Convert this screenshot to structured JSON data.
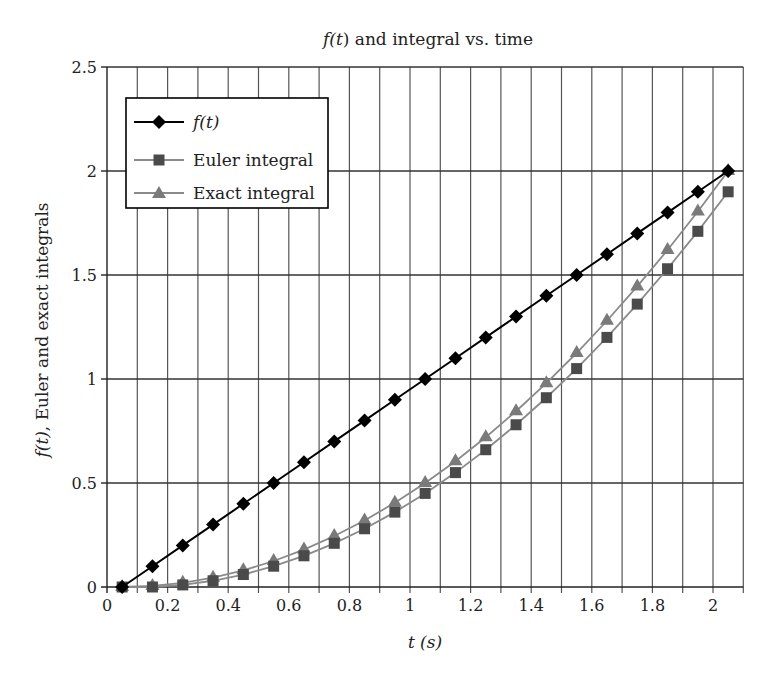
{
  "chart_data": {
    "type": "line",
    "title": "f(t) and integral vs. time",
    "xlabel": "t (s)",
    "ylabel": "f(t), Euler and exact integrals",
    "xlim": [
      0,
      2.1
    ],
    "ylim": [
      0,
      2.5
    ],
    "xticks": [
      0,
      0.2,
      0.4,
      0.6,
      0.8,
      1,
      1.2,
      1.4,
      1.6,
      1.8,
      2
    ],
    "xtick_labels": [
      "0",
      "0.2",
      "0.4",
      "0.6",
      "0.8",
      "1",
      "1.2",
      "1.4",
      "1.6",
      "1.8",
      "2"
    ],
    "yticks": [
      0,
      0.5,
      1,
      1.5,
      2,
      2.5
    ],
    "ytick_labels": [
      "0",
      "0.5",
      "1",
      "1.5",
      "2",
      "2.5"
    ],
    "grid": {
      "vertical_step": 0.1,
      "horizontal_step": 0.5
    },
    "legend_position": "upper-left",
    "x": [
      0.05,
      0.15,
      0.25,
      0.35,
      0.45,
      0.55,
      0.65,
      0.75,
      0.85,
      0.95,
      1.05,
      1.15,
      1.25,
      1.35,
      1.45,
      1.55,
      1.65,
      1.75,
      1.85,
      1.95,
      2.05
    ],
    "series": [
      {
        "name": "f(t)",
        "marker": "diamond",
        "color": "#000000",
        "values": [
          0,
          0.1,
          0.2,
          0.3,
          0.4,
          0.5,
          0.6,
          0.7,
          0.8,
          0.9,
          1.0,
          1.1,
          1.2,
          1.3,
          1.4,
          1.5,
          1.6,
          1.7,
          1.8,
          1.9,
          2.0
        ]
      },
      {
        "name": "Euler integral",
        "marker": "square",
        "color": "#4a4a4a",
        "line_color": "#8a8a8a",
        "values": [
          0,
          0,
          0.01,
          0.03,
          0.06,
          0.1,
          0.15,
          0.21,
          0.28,
          0.36,
          0.45,
          0.55,
          0.66,
          0.78,
          0.91,
          1.05,
          1.2,
          1.36,
          1.53,
          1.71,
          1.9
        ]
      },
      {
        "name": "Exact integral",
        "marker": "triangle",
        "color": "#7a7a7a",
        "line_color": "#8a8a8a",
        "values": [
          0,
          0.005,
          0.02,
          0.045,
          0.08,
          0.125,
          0.18,
          0.245,
          0.32,
          0.405,
          0.5,
          0.605,
          0.72,
          0.845,
          0.98,
          1.125,
          1.28,
          1.445,
          1.62,
          1.805,
          2.0
        ]
      }
    ]
  },
  "legend": {
    "items": [
      {
        "label": "f(t)"
      },
      {
        "label": "Euler integral"
      },
      {
        "label": "Exact integral"
      }
    ]
  }
}
